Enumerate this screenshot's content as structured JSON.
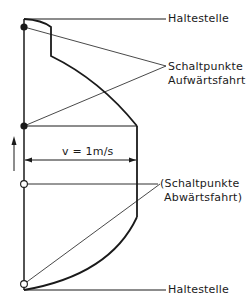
{
  "diagram": {
    "type": "elevator-speed-profile",
    "labels": {
      "top_stop": "Haltestelle",
      "bottom_stop": "Haltestelle",
      "up_switch_line1": "Schaltpunkte",
      "up_switch_line2": "Aufwärtsfahrt",
      "down_switch_line1": "(Schaltpunkte",
      "down_switch_line2": "Abwärtsfahrt)",
      "speed": "v = 1m/s"
    },
    "colors": {
      "line": "#1a1a1a",
      "background": "#ffffff"
    }
  }
}
